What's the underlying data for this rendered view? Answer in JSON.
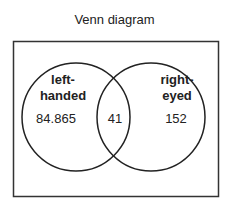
{
  "title": "Venn diagram",
  "sets": [
    {
      "name_line1": "left-",
      "name_line2": "handed",
      "only_value": "84.865"
    },
    {
      "name_line1": "right-",
      "name_line2": "eyed",
      "only_value": "152"
    }
  ],
  "intersection_value": "41",
  "colors": {
    "stroke": "#222222",
    "background": "#ffffff"
  }
}
